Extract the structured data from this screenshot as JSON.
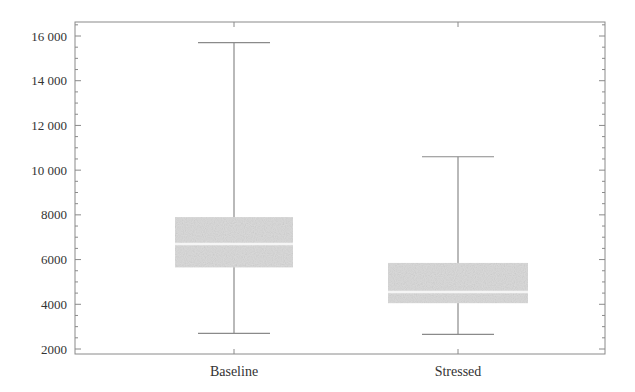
{
  "chart_data": {
    "type": "box",
    "title": "",
    "xlabel": "",
    "ylabel": "",
    "categories": [
      "Baseline",
      "Stressed"
    ],
    "ylim": [
      1800,
      16700
    ],
    "yticks": [
      2000,
      4000,
      6000,
      8000,
      10000,
      12000,
      14000,
      16000
    ],
    "ytick_labels": [
      "2000",
      "4000",
      "6000",
      "8000",
      "10 000",
      "12 000",
      "14 000",
      "16 000"
    ],
    "grid": false,
    "legend": null,
    "series": [
      {
        "name": "Baseline",
        "whisker_high": 15700,
        "q3": 7900,
        "median": 6700,
        "q1": 5650,
        "whisker_low": 2700
      },
      {
        "name": "Stressed",
        "whisker_high": 10600,
        "q3": 5850,
        "median": 4550,
        "q1": 4050,
        "whisker_low": 2650
      }
    ],
    "colors": {
      "box_fill": "#dcdcdc",
      "median_line": "#f5f5f5",
      "whisker": "#8a8a8a",
      "frame": "#8a8a8a",
      "text": "#333333"
    }
  }
}
